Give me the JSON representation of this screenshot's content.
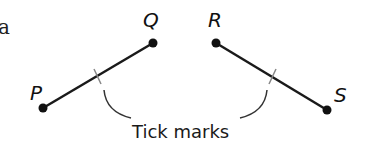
{
  "diagram": {
    "edge_fragment": "a",
    "segments": [
      {
        "name": "PQ",
        "start_label": "P",
        "end_label": "Q"
      },
      {
        "name": "RS",
        "start_label": "R",
        "end_label": "S"
      }
    ],
    "annotation": "Tick marks",
    "colors": {
      "line": "#1a1a1a",
      "tick": "#888888",
      "background": "#ffffff"
    }
  }
}
